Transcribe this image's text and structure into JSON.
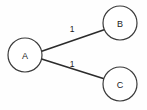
{
  "diagram": {
    "type": "weighted-graph",
    "background_color": "#fefefe",
    "node_fill_color": "#ffffff",
    "node_stroke_color": "#3a3a3a",
    "edge_color": "#2b2b2b",
    "text_color": "#1a1a1a",
    "nodes": [
      {
        "id": "A",
        "label": "A",
        "cx": 25,
        "cy": 55,
        "r": 17
      },
      {
        "id": "B",
        "label": "B",
        "cx": 120,
        "cy": 23,
        "r": 17
      },
      {
        "id": "C",
        "label": "C",
        "cx": 120,
        "cy": 84,
        "r": 17
      }
    ],
    "edges": [
      {
        "from": "A",
        "to": "B",
        "weight": "1",
        "x1": 41.7,
        "y1": 51.2,
        "x2": 103.4,
        "y2": 29.9,
        "label_x": 72,
        "label_y": 29
      },
      {
        "from": "A",
        "to": "C",
        "weight": "1",
        "x1": 41.6,
        "y1": 59.0,
        "x2": 103.3,
        "y2": 78.6,
        "label_x": 72,
        "label_y": 64
      }
    ]
  }
}
